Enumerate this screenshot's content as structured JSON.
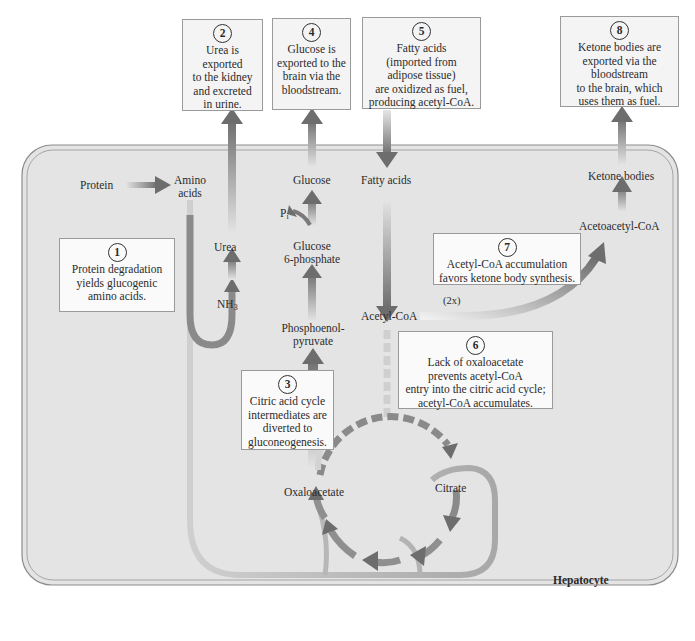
{
  "figure": {
    "cell_label": "Hepatocyte",
    "colors": {
      "cell_fill": "#e3e3e3",
      "cell_border": "#8c8c8c",
      "arrow_dark": "#6f6f6f",
      "arrow_light": "#d8d8d8",
      "box_fill": "#f4f4f4",
      "box_border": "#9a9a9a"
    }
  },
  "callouts": [
    {
      "number": "1",
      "text": "Protein degradation\nyields glucogenic\namino acids."
    },
    {
      "number": "2",
      "text": "Urea is\nexported\nto the kidney\nand excreted\nin urine."
    },
    {
      "number": "3",
      "text": "Citric acid cycle\nintermediates are\ndiverted to\ngluconeogenesis."
    },
    {
      "number": "4",
      "text": "Glucose is\nexported to the\nbrain via the\nbloodstream."
    },
    {
      "number": "5",
      "text": "Fatty acids\n(imported from\nadipose tissue)\nare oxidized as fuel,\nproducing acetyl-CoA."
    },
    {
      "number": "6",
      "text": "Lack of oxaloacetate\nprevents acetyl-CoA\nentry into the citric acid cycle;\nacetyl-CoA accumulates."
    },
    {
      "number": "7",
      "text": "Acetyl-CoA accumulation\nfavors ketone body synthesis."
    },
    {
      "number": "8",
      "text": "Ketone bodies are\nexported via the\nbloodstream\nto the brain, which\nuses them as fuel."
    }
  ],
  "metabolites": {
    "protein": "Protein",
    "amino_acids_1": "Amino",
    "amino_acids_2": "acids",
    "urea": "Urea",
    "nh3_main": "NH",
    "nh3_sub": "3",
    "glucose": "Glucose",
    "pi_main": "P",
    "pi_sub": "i",
    "g6p_1": "Glucose",
    "g6p_2": "6-phosphate",
    "pep_1": "Phosphoenol-",
    "pep_2": "pyruvate",
    "fatty_acids": "Fatty acids",
    "acetyl_coa": "Acetyl-CoA",
    "two_x": "(2x)",
    "acetoacetyl_coa": "Acetoacetyl-CoA",
    "ketone_bodies": "Ketone bodies",
    "oxaloacetate": "Oxaloacetate",
    "citrate": "Citrate"
  }
}
